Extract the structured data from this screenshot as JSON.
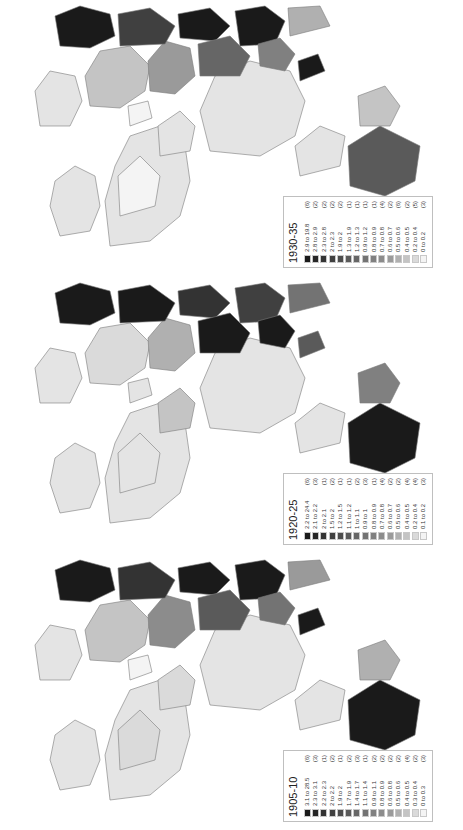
{
  "figure": {
    "orientation": "rotated-90-ccw",
    "panels": [
      {
        "title": "1930-35",
        "legend": [
          {
            "range": "2.9 to 19.8",
            "count": "(6)",
            "color": "#1a1a1a"
          },
          {
            "range": "2.8 to 2.9",
            "count": "(2)",
            "color": "#262626"
          },
          {
            "range": "2.3 to 2.8",
            "count": "(2)",
            "color": "#333333"
          },
          {
            "range": "2 to 2.3",
            "count": "(2)",
            "color": "#404040"
          },
          {
            "range": "1.9 to 2",
            "count": "(2)",
            "color": "#4d4d4d"
          },
          {
            "range": "1.3 to 1.9",
            "count": "(1)",
            "color": "#5a5a5a"
          },
          {
            "range": "1.2 to 1.3",
            "count": "(1)",
            "color": "#666666"
          },
          {
            "range": "0.9 to 1.2",
            "count": "(1)",
            "color": "#737373"
          },
          {
            "range": "0.8 to 0.9",
            "count": "(1)",
            "color": "#808080"
          },
          {
            "range": "0.7 to 0.8",
            "count": "(4)",
            "color": "#8c8c8c"
          },
          {
            "range": "0.6 to 0.7",
            "count": "(2)",
            "color": "#9a9a9a"
          },
          {
            "range": "0.5 to 0.6",
            "count": "(6)",
            "color": "#b0b0b0"
          },
          {
            "range": "0.4 to 0.5",
            "count": "(2)",
            "color": "#c4c4c4"
          },
          {
            "range": "0.2 to 0.4",
            "count": "(5)",
            "color": "#dadada"
          },
          {
            "range": "0 to 0.2",
            "count": "(3)",
            "color": "#f4f4f4"
          }
        ]
      },
      {
        "title": "1920-25",
        "legend": [
          {
            "range": "2.2 to 24.4",
            "count": "(6)",
            "color": "#1a1a1a"
          },
          {
            "range": "2.1 to 2.2",
            "count": "(3)",
            "color": "#262626"
          },
          {
            "range": "2 to 2.1",
            "count": "(1)",
            "color": "#333333"
          },
          {
            "range": "1.5 to 2",
            "count": "(2)",
            "color": "#404040"
          },
          {
            "range": "1.2 to 1.5",
            "count": "(1)",
            "color": "#4d4d4d"
          },
          {
            "range": "1.1 to 1.2",
            "count": "(1)",
            "color": "#5a5a5a"
          },
          {
            "range": "1 to 1.1",
            "count": "(2)",
            "color": "#666666"
          },
          {
            "range": "0.9 to 1",
            "count": "(3)",
            "color": "#737373"
          },
          {
            "range": "0.8 to 0.9",
            "count": "(1)",
            "color": "#808080"
          },
          {
            "range": "0.7 to 0.8",
            "count": "(4)",
            "color": "#8c8c8c"
          },
          {
            "range": "0.6 to 0.7",
            "count": "(2)",
            "color": "#9a9a9a"
          },
          {
            "range": "0.5 to 0.6",
            "count": "(2)",
            "color": "#b0b0b0"
          },
          {
            "range": "0.4 to 0.5",
            "count": "(4)",
            "color": "#c4c4c4"
          },
          {
            "range": "0.2 to 0.4",
            "count": "(4)",
            "color": "#dadada"
          },
          {
            "range": "0.1 to 0.2",
            "count": "(3)",
            "color": "#f4f4f4"
          }
        ]
      },
      {
        "title": "1905-10",
        "legend": [
          {
            "range": "3.1 to 28.5",
            "count": "(6)",
            "color": "#1a1a1a"
          },
          {
            "range": "2.3 to 3.1",
            "count": "(3)",
            "color": "#262626"
          },
          {
            "range": "2.2 to 2.3",
            "count": "(1)",
            "color": "#333333"
          },
          {
            "range": "2 to 2.2",
            "count": "(2)",
            "color": "#404040"
          },
          {
            "range": "1.9 to 2",
            "count": "(1)",
            "color": "#4d4d4d"
          },
          {
            "range": "1.7 to 1.9",
            "count": "(2)",
            "color": "#5a5a5a"
          },
          {
            "range": "1.4 to 1.7",
            "count": "(3)",
            "color": "#666666"
          },
          {
            "range": "1.1 to 1.4",
            "count": "(1)",
            "color": "#737373"
          },
          {
            "range": "0.9 to 1.1",
            "count": "(2)",
            "color": "#808080"
          },
          {
            "range": "0.8 to 0.9",
            "count": "(2)",
            "color": "#8c8c8c"
          },
          {
            "range": "0.6 to 0.8",
            "count": "(2)",
            "color": "#9a9a9a"
          },
          {
            "range": "0.5 to 0.6",
            "count": "(2)",
            "color": "#b0b0b0"
          },
          {
            "range": "0.4 to 0.5",
            "count": "(4)",
            "color": "#c4c4c4"
          },
          {
            "range": "0.3 to 0.4",
            "count": "(2)",
            "color": "#dadada"
          },
          {
            "range": "0 to 0.3",
            "count": "(3)",
            "color": "#f4f4f4"
          }
        ]
      }
    ],
    "colors": {
      "background": "#ffffff",
      "border": "#7a7a7a",
      "light_fill": "#e4e4e4",
      "dark_fill": "#1a1a1a"
    }
  }
}
